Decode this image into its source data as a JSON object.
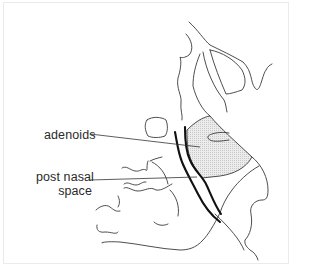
{
  "diagram": {
    "type": "anatomical line drawing (lateral view of nasopharynx)",
    "labels": [
      {
        "id": "adenoids",
        "text": "adenoids"
      },
      {
        "id": "post_nasal_space",
        "lines": [
          "post nasal",
          "space"
        ]
      }
    ],
    "colors": {
      "line": "#3a3a3a",
      "thick_line": "#111111",
      "shaded_region": "#e4e4e4",
      "background": "#ffffff",
      "frame": "#ebebeb"
    }
  }
}
